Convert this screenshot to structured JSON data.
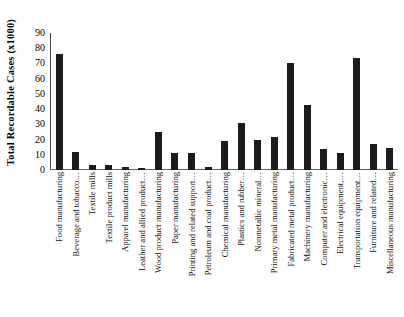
{
  "chart_data": {
    "type": "bar",
    "title": "",
    "xlabel": "",
    "ylabel": "Total Recordable Cases (x1000)",
    "ylim": [
      0,
      90
    ],
    "ytick_labels": [
      "90",
      "80",
      "70",
      "60",
      "50",
      "40",
      "30",
      "20",
      "10",
      "0"
    ],
    "ytick_values": [
      90,
      80,
      70,
      60,
      50,
      40,
      30,
      20,
      10,
      0
    ],
    "grid": false,
    "legend": false,
    "bar_color": "#1c1c1c",
    "categories": [
      "Food manufacturing",
      "Beverage and tobacco…",
      "Textile mills",
      "Textile product mills",
      "Apparel manufacturing",
      "Leather and allied product…",
      "Wood product manufacturing",
      "Paper manufacturing",
      "Printing and related support…",
      "Petroleum and coal product…",
      "Chemical manufacturing",
      "Plastics and rubber…",
      "Nonmetallic mineral…",
      "Primary metal manufacturing",
      "Fabricated metal product…",
      "Machinery manufacturing",
      "Computer and electronic…",
      "Electrical equipment,…",
      "Transportation equipment…",
      "Furniture and related…",
      "Miscellaneous manufacturing"
    ],
    "values": [
      76.5,
      11.8,
      3.5,
      3.5,
      2.0,
      1.0,
      25.0,
      11.2,
      11.0,
      1.8,
      19.0,
      30.8,
      19.8,
      21.8,
      70.5,
      43.0,
      13.5,
      11.5,
      73.5,
      16.8,
      14.5
    ]
  }
}
